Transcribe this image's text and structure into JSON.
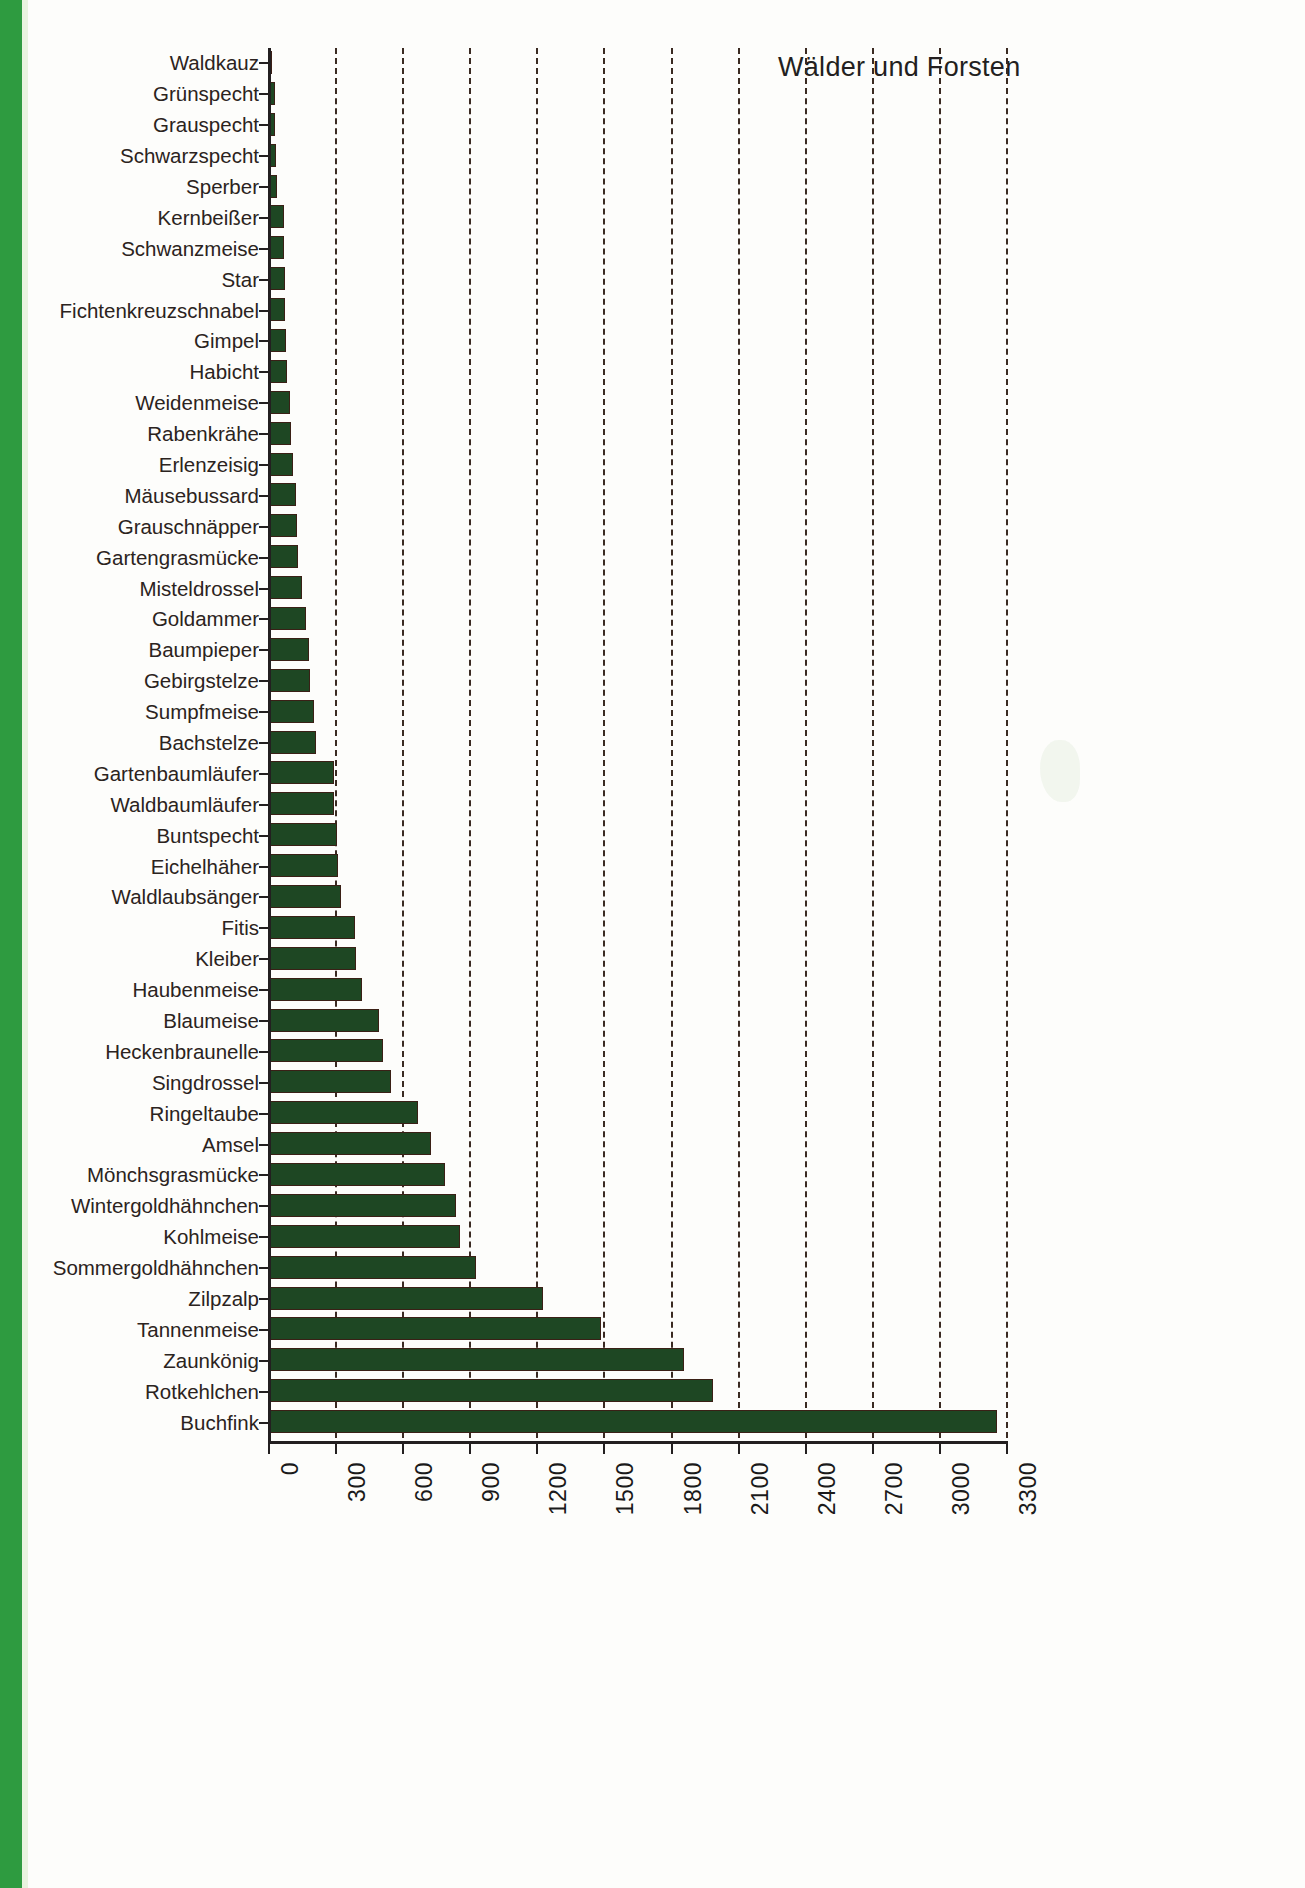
{
  "chart_data": {
    "type": "bar",
    "orientation": "horizontal",
    "title": "Wälder und Forsten",
    "xlabel": "",
    "ylabel": "",
    "xlim": [
      0,
      3300
    ],
    "grid": true,
    "grid_style": "dashed vertical",
    "legend": null,
    "bar_color": "#1e4723",
    "bar_border_color": "#3a2016",
    "xticks": [
      "0",
      "300",
      "600",
      "900",
      "1200",
      "1500",
      "1800",
      "2100",
      "2400",
      "2700",
      "3000",
      "3300"
    ],
    "xtick_values": [
      0,
      300,
      600,
      900,
      1200,
      1500,
      1800,
      2100,
      2400,
      2700,
      3000,
      3300
    ],
    "categories": [
      "Waldkauz",
      "Grünspecht",
      "Grauspecht",
      "Schwarzspecht",
      "Sperber",
      "Kernbeißer",
      "Schwanzmeise",
      "Star",
      "Fichtenkreuzschnabel",
      "Gimpel",
      "Habicht",
      "Weidenmeise",
      "Rabenkrähe",
      "Erlenzeisig",
      "Mäusebussard",
      "Grauschnäpper",
      "Gartengrasmücke",
      "Misteldrossel",
      "Goldammer",
      "Baumpieper",
      "Gebirgstelze",
      "Sumpfmeise",
      "Bachstelze",
      "Gartenbaumläufer",
      "Waldbaumläufer",
      "Buntspecht",
      "Eichelhäher",
      "Waldlaubsänger",
      "Fitis",
      "Kleiber",
      "Haubenmeise",
      "Blaumeise",
      "Heckenbraunelle",
      "Singdrossel",
      "Ringeltaube",
      "Amsel",
      "Mönchsgrasmücke",
      "Wintergoldhähnchen",
      "Kohlmeise",
      "Sommergoldhähnchen",
      "Zilpzalp",
      "Tannenmeise",
      "Zaunkönig",
      "Rotkehlchen",
      "Buchfink"
    ],
    "values": [
      20,
      30,
      32,
      35,
      40,
      70,
      72,
      75,
      78,
      82,
      85,
      100,
      105,
      110,
      125,
      130,
      135,
      150,
      170,
      185,
      190,
      205,
      215,
      295,
      297,
      310,
      315,
      325,
      390,
      392,
      420,
      495,
      515,
      550,
      670,
      730,
      790,
      840,
      860,
      930,
      1230,
      1490,
      1860,
      1990,
      3260
    ]
  }
}
